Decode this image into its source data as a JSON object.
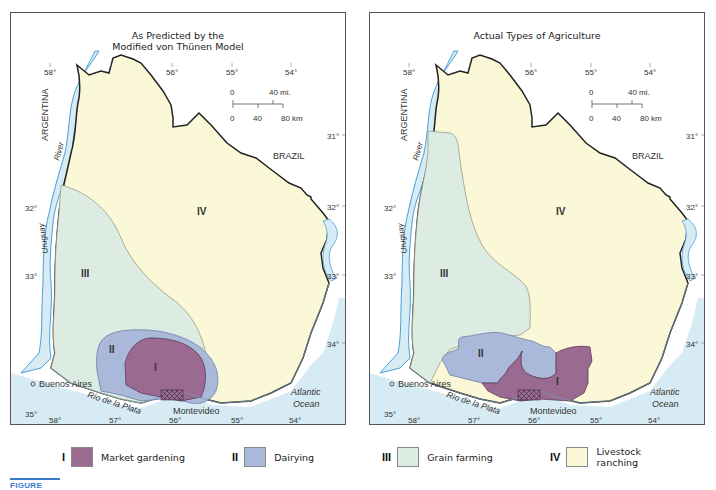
{
  "figure": {
    "caption_prefix": "FIGURE",
    "colors": {
      "market_gardening": "#9b6a91",
      "dairying": "#aab8d9",
      "grain_farming": "#dcece3",
      "livestock_ranching": "#fbf8d8",
      "water": "#d7ebf4",
      "river_line": "#4aa0d8",
      "caption_accent": "#3a7bc8"
    }
  },
  "maps": [
    {
      "title_line1": "As Predicted by the",
      "title_line2": "Modified von Thünen Model"
    },
    {
      "title_line1": "Actual Types of Agriculture",
      "title_line2": ""
    }
  ],
  "labels": {
    "argentina": "ARGENTINA",
    "brazil": "BRAZIL",
    "river": "River",
    "uruguay": "Uruguay",
    "buenos_aires": "Buenos Aires",
    "rio_de_la_plata": "Río de la Plata",
    "montevideo": "Montevideo",
    "atlantic": "Atlantic",
    "ocean": "Ocean",
    "zone_I": "I",
    "zone_II": "II",
    "zone_III": "III",
    "zone_IV": "IV"
  },
  "grid": {
    "top_longitudes": [
      "58°",
      "56°",
      "55°",
      "54°"
    ],
    "bottom_longitudes": [
      "58°",
      "57°",
      "56°",
      "55°",
      "54°"
    ],
    "left_latitudes": [
      "32°",
      "33°",
      "35°"
    ],
    "right_latitudes": [
      "31°",
      "32°",
      "33°",
      "34°"
    ]
  },
  "scale_bar": {
    "mi_zero": "0",
    "mi_label": "40 mi.",
    "km_zero": "0",
    "km_mid": "40",
    "km_label": "80 km"
  },
  "legend": [
    {
      "numeral": "I",
      "label": "Market gardening",
      "color": "#9b6a91"
    },
    {
      "numeral": "II",
      "label": "Dairying",
      "color": "#aab8d9"
    },
    {
      "numeral": "III",
      "label": "Grain farming",
      "color": "#dcece3"
    },
    {
      "numeral": "IV",
      "label": "Livestock ranching",
      "color": "#fbf8d8"
    }
  ]
}
